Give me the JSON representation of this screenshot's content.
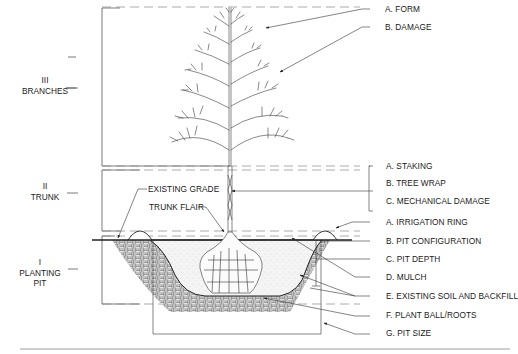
{
  "sections": [
    {
      "numeral": "III",
      "name": "BRANCHES"
    },
    {
      "numeral": "II",
      "name": "TRUNK"
    },
    {
      "numeral": "I",
      "name": "PLANTING",
      "name2": "PIT"
    }
  ],
  "branches_labels": [
    "A. FORM",
    "B. DAMAGE"
  ],
  "trunk_labels": [
    "A. STAKING",
    "B. TREE WRAP",
    "C. MECHANICAL DAMAGE"
  ],
  "pit_labels": [
    "A. IRRIGATION RING",
    "B. PIT CONFIGURATION",
    "C. PIT DEPTH",
    "D. MULCH",
    "E. EXISTING SOIL AND BACKFILL",
    "F. PLANT BALL/ROOTS",
    "G. PIT SIZE"
  ],
  "callouts": {
    "existing_grade": "EXISTING GRADE",
    "trunk_flair": "TRUNK FLAIR"
  },
  "colors": {
    "line": "#333333",
    "dash": "#777777",
    "hatch": "#555555"
  }
}
